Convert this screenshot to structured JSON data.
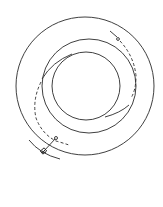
{
  "diagram": {
    "type": "technical line drawing",
    "colors": {
      "line": "#2a2a2a",
      "background": "#ffffff"
    },
    "circles": [
      {
        "name": "outer-ring",
        "cx": 85,
        "cy": 86,
        "r": 69
      },
      {
        "name": "middle-ring",
        "cx": 89,
        "cy": 86,
        "r": 47
      },
      {
        "name": "inner-ring",
        "cx": 86,
        "cy": 86,
        "r": 34
      }
    ],
    "labels": []
  }
}
